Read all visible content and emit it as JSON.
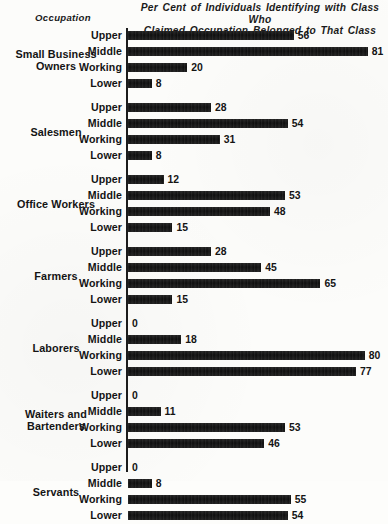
{
  "chart_data": {
    "type": "bar",
    "title": "Per Cent of Individuals Identifying with Class Who Claimed Occupation Belonged to That Class",
    "title_line1": "Per Cent of Individuals Identifying with Class Who",
    "title_line2": "Claimed Occupation Belonged to That Class",
    "axis_caption": "Occupation",
    "xlabel": "",
    "ylabel": "Occupation",
    "xlim": [
      0,
      85
    ],
    "grid": false,
    "legend": "none",
    "orientation": "horizontal",
    "categories": [
      "Upper",
      "Middle",
      "Working",
      "Lower"
    ],
    "groups": [
      {
        "name": "Small Business Owners",
        "name_line1": "Small Business",
        "name_line2": "Owners",
        "rows": [
          {
            "label": "Upper",
            "value": 56
          },
          {
            "label": "Middle",
            "value": 81
          },
          {
            "label": "Working",
            "value": 20
          },
          {
            "label": "Lower",
            "value": 8
          }
        ]
      },
      {
        "name": "Salesmen",
        "name_line1": "Salesmen",
        "name_line2": "",
        "rows": [
          {
            "label": "Upper",
            "value": 28
          },
          {
            "label": "Middle",
            "value": 54
          },
          {
            "label": "Working",
            "value": 31
          },
          {
            "label": "Lower",
            "value": 8
          }
        ]
      },
      {
        "name": "Office Workers",
        "name_line1": "Office Workers",
        "name_line2": "",
        "rows": [
          {
            "label": "Upper",
            "value": 12
          },
          {
            "label": "Middle",
            "value": 53
          },
          {
            "label": "Working",
            "value": 48
          },
          {
            "label": "Lower",
            "value": 15
          }
        ]
      },
      {
        "name": "Farmers",
        "name_line1": "Farmers",
        "name_line2": "",
        "rows": [
          {
            "label": "Upper",
            "value": 28
          },
          {
            "label": "Middle",
            "value": 45
          },
          {
            "label": "Working",
            "value": 65
          },
          {
            "label": "Lower",
            "value": 15
          }
        ]
      },
      {
        "name": "Laborers",
        "name_line1": "Laborers",
        "name_line2": "",
        "rows": [
          {
            "label": "Upper",
            "value": 0
          },
          {
            "label": "Middle",
            "value": 18
          },
          {
            "label": "Working",
            "value": 80
          },
          {
            "label": "Lower",
            "value": 77
          }
        ]
      },
      {
        "name": "Waiters and Bartenders",
        "name_line1": "Waiters and",
        "name_line2": "Bartenders",
        "rows": [
          {
            "label": "Upper",
            "value": 0
          },
          {
            "label": "Middle",
            "value": 11
          },
          {
            "label": "Working",
            "value": 53
          },
          {
            "label": "Lower",
            "value": 46
          }
        ]
      },
      {
        "name": "Servants",
        "name_line1": "Servants",
        "name_line2": "",
        "rows": [
          {
            "label": "Upper",
            "value": 0
          },
          {
            "label": "Middle",
            "value": 8
          },
          {
            "label": "Working",
            "value": 55
          },
          {
            "label": "Lower",
            "value": 54
          }
        ]
      }
    ]
  },
  "style": {
    "bar_color": "#111111",
    "background_color": "#fcfcfa",
    "axis_color": "#1c1c1c",
    "px_per_unit": 2.96,
    "row_pitch": 16,
    "group_gap": 8
  }
}
